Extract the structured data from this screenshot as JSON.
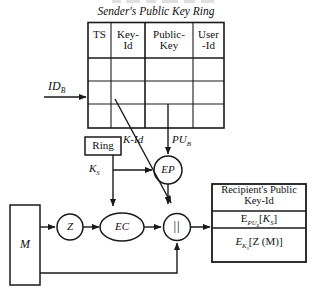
{
  "diagram": {
    "title": "Sender's Public Key Ring",
    "key_ring_table": {
      "columns": [
        "TS",
        "Key-Id",
        "Public-Key",
        "User-Id"
      ],
      "column_lines": [
        [
          "TS"
        ],
        [
          "Key-",
          "Id"
        ],
        [
          "Public-",
          "Key"
        ],
        [
          "User",
          "-Id"
        ]
      ],
      "empty_rows": 3
    },
    "inputs": {
      "id_b_label": "ID",
      "id_b_sub": "B",
      "message_label": "M"
    },
    "ring_box_label": "Ring",
    "edge_labels": {
      "k_id": "K-Id",
      "pu_b": "PU",
      "pu_b_sub": "B",
      "k_s": "K",
      "k_s_sub": "S"
    },
    "nodes": {
      "ep": "EP",
      "ec": "EC",
      "z": "Z",
      "concat": "||"
    },
    "output_box": {
      "header_line1": "Recipient's Public",
      "header_line2": "Key-Id",
      "row1": {
        "base": "E",
        "sub": "PU",
        "subsub": "B",
        "bracket_open": "[",
        "inner": "K",
        "inner_sub": "S",
        "bracket_close": "]"
      },
      "row2": {
        "base": "E",
        "sub": "K",
        "subsub": "S",
        "bracket_open": "[",
        "inner": "Z (M)",
        "bracket_close": "]"
      }
    },
    "colors": {
      "line": "#1a1a1a",
      "text": "#111111",
      "background": "#ffffff"
    }
  }
}
